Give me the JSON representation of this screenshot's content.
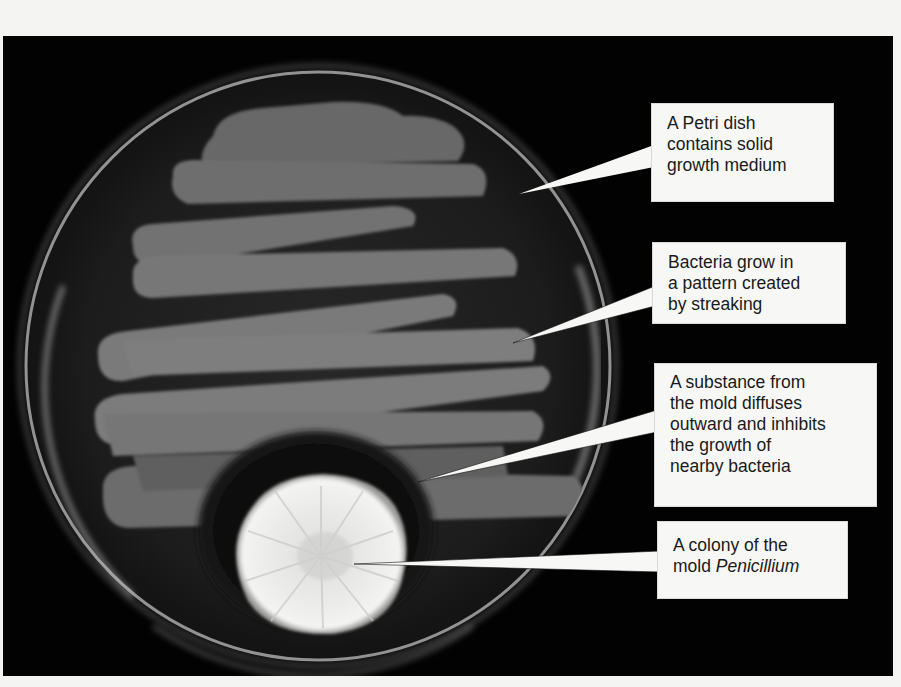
{
  "figure": {
    "colors": {
      "background": "#020202",
      "page": "#f4f4f2",
      "callout_fill": "#f7f7f5",
      "callout_text": "#1a1a1a",
      "agar": "#1c1c1c",
      "bacteria_streak": "#7d7d7d",
      "mold_colony": "#e8e8e6",
      "inhibition_zone": "#111111"
    }
  },
  "callouts": [
    {
      "id": "petri-dish",
      "lines": [
        "A Petri dish",
        "contains solid",
        "growth medium"
      ],
      "italic_last_word": false
    },
    {
      "id": "bacteria-streaks",
      "lines": [
        "Bacteria grow in",
        "a pattern created",
        "by streaking"
      ],
      "italic_last_word": false
    },
    {
      "id": "inhibition-zone",
      "lines": [
        "A substance from",
        "the mold diffuses",
        "outward and inhibits",
        "the growth of",
        "nearby bacteria"
      ],
      "italic_last_word": false
    },
    {
      "id": "mold-colony",
      "lines": [
        "A colony of the",
        "mold "
      ],
      "italic_word": "Penicillium"
    }
  ]
}
